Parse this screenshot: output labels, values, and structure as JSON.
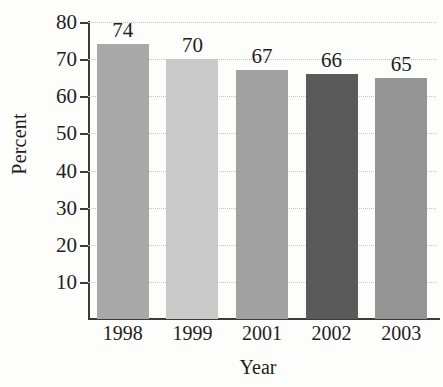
{
  "chart_data": {
    "type": "bar",
    "title": "",
    "subtitle": "",
    "xlabel": "Year",
    "ylabel": "Percent",
    "categories": [
      "1998",
      "1999",
      "2001",
      "2002",
      "2003"
    ],
    "values": [
      74,
      70,
      67,
      66,
      65
    ],
    "data_labels": [
      "74",
      "70",
      "67",
      "66",
      "65"
    ],
    "bar_colors": [
      "#a9a9a9",
      "#c9c9c9",
      "#a1a1a1",
      "#5a5a5a",
      "#959595"
    ],
    "ylim": [
      0,
      80
    ],
    "ytick_values": [
      10,
      20,
      30,
      40,
      50,
      60,
      70,
      80
    ],
    "ytick_labels": [
      "10",
      "20",
      "30",
      "40",
      "50",
      "60",
      "70",
      "80"
    ],
    "grid": true,
    "grid_style": "dotted",
    "grid_color": "#c4c4c0",
    "legend": false,
    "legend_position": "none",
    "axis_color": "#3a3a3a",
    "background_color": "#fdfdfc",
    "text_color": "#1d1d1d",
    "annotations": []
  }
}
